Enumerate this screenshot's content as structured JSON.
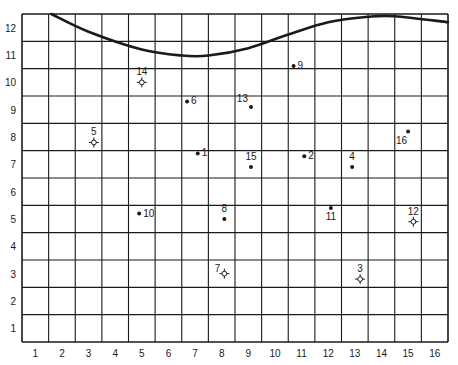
{
  "grid": {
    "x_ticks": [
      "1",
      "2",
      "3",
      "4",
      "5",
      "6",
      "7",
      "8",
      "9",
      "10",
      "11",
      "12",
      "13",
      "14",
      "15",
      "16"
    ],
    "y_ticks": [
      "1",
      "2",
      "3",
      "4",
      "5",
      "6",
      "7",
      "8",
      "9",
      "10",
      "11",
      "12"
    ],
    "columns": 16,
    "rows": 12,
    "line_color": "#1a1a1a",
    "background": "#ffffff"
  },
  "curve": {
    "description": "thick boundary curve across top of grid",
    "points": [
      [
        1.6,
        12.5
      ],
      [
        3,
        11.85
      ],
      [
        5,
        11.2
      ],
      [
        6.5,
        10.98
      ],
      [
        7.5,
        10.98
      ],
      [
        9,
        11.25
      ],
      [
        10.5,
        11.75
      ],
      [
        12,
        12.2
      ],
      [
        13.5,
        12.4
      ],
      [
        14.5,
        12.42
      ],
      [
        16,
        12.2
      ]
    ]
  },
  "points": [
    {
      "id": "1",
      "x": 7.1,
      "y": 7.4,
      "symbol": "dot",
      "label_pos": "right"
    },
    {
      "id": "2",
      "x": 11.1,
      "y": 7.3,
      "symbol": "dot",
      "label_pos": "right"
    },
    {
      "id": "3",
      "x": 13.2,
      "y": 2.8,
      "symbol": "star",
      "label_pos": "above"
    },
    {
      "id": "4",
      "x": 12.9,
      "y": 6.9,
      "symbol": "dot",
      "label_pos": "above"
    },
    {
      "id": "5",
      "x": 3.2,
      "y": 7.8,
      "symbol": "star",
      "label_pos": "above"
    },
    {
      "id": "6",
      "x": 6.7,
      "y": 9.3,
      "symbol": "dot",
      "label_pos": "right"
    },
    {
      "id": "7",
      "x": 8.1,
      "y": 3.0,
      "symbol": "star",
      "label_pos": "left"
    },
    {
      "id": "8",
      "x": 8.1,
      "y": 5.0,
      "symbol": "dot",
      "label_pos": "above"
    },
    {
      "id": "9",
      "x": 10.7,
      "y": 10.6,
      "symbol": "dot",
      "label_pos": "right"
    },
    {
      "id": "10",
      "x": 4.9,
      "y": 5.2,
      "symbol": "dot",
      "label_pos": "right"
    },
    {
      "id": "11",
      "x": 12.1,
      "y": 5.4,
      "symbol": "dot",
      "label_pos": "below"
    },
    {
      "id": "12",
      "x": 15.2,
      "y": 4.9,
      "symbol": "star",
      "label_pos": "above"
    },
    {
      "id": "13",
      "x": 9.1,
      "y": 9.1,
      "symbol": "dot",
      "label_pos": "upper-left"
    },
    {
      "id": "14",
      "x": 5.0,
      "y": 10.0,
      "symbol": "star",
      "label_pos": "above"
    },
    {
      "id": "15",
      "x": 9.1,
      "y": 6.9,
      "symbol": "dot",
      "label_pos": "above"
    },
    {
      "id": "16",
      "x": 15.0,
      "y": 8.2,
      "symbol": "dot",
      "label_pos": "lower-left"
    }
  ]
}
